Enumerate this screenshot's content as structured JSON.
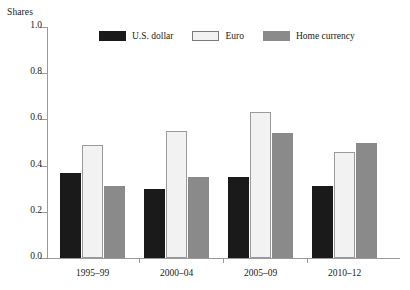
{
  "chart_data": {
    "type": "bar",
    "title": "",
    "xlabel": "",
    "ylabel": "Shares",
    "ylim": [
      0.0,
      1.0
    ],
    "ytick_labels": [
      "0.0",
      "0.2",
      "0.4",
      "0.6",
      "0.8",
      "1.0"
    ],
    "ytick_values": [
      0.0,
      0.2,
      0.4,
      0.6,
      0.8,
      1.0
    ],
    "grid": false,
    "legend_position": "top-center",
    "categories": [
      "1995–99",
      "2000–04",
      "2005–09",
      "2010–12"
    ],
    "series": [
      {
        "name": "U.S. dollar",
        "color": "#1a1a1a",
        "values": [
          0.37,
          0.3,
          0.35,
          0.31
        ]
      },
      {
        "name": "Euro",
        "color": "#f2f2f2",
        "values": [
          0.49,
          0.55,
          0.63,
          0.46
        ]
      },
      {
        "name": "Home currency",
        "color": "#8a8a8a",
        "values": [
          0.31,
          0.35,
          0.54,
          0.5
        ]
      }
    ]
  }
}
